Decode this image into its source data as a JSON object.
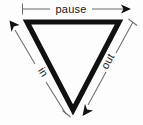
{
  "diagram": {
    "shape": {
      "name": "inverted-triangle",
      "vertices": [
        {
          "x": 27,
          "y": 22
        },
        {
          "x": 119,
          "y": 22
        },
        {
          "x": 73,
          "y": 110
        }
      ],
      "stroke_color": "#111111",
      "fill_color": "none"
    },
    "background_color": "#fdfdfd",
    "annotation_color": "#6d6d6d",
    "labels": {
      "top": "pause",
      "left": "in",
      "right": "out"
    },
    "arrows": [
      {
        "name": "pause-arrow",
        "label": "pause",
        "from": {
          "x": 22,
          "y": 9
        },
        "to": {
          "x": 130,
          "y": 9
        },
        "start_cap": "tick",
        "end_cap": "arrowhead",
        "direction": "right"
      },
      {
        "name": "in-arrow",
        "label": "in",
        "from": {
          "x": 66,
          "y": 114
        },
        "to": {
          "x": 10,
          "y": 22
        },
        "start_cap": "tick",
        "end_cap": "arrowhead",
        "direction": "up-left"
      },
      {
        "name": "out-arrow",
        "label": "out",
        "from": {
          "x": 133,
          "y": 22
        },
        "to": {
          "x": 82,
          "y": 115
        },
        "start_cap": "tick",
        "end_cap": "arrowhead",
        "direction": "down-left"
      }
    ]
  }
}
